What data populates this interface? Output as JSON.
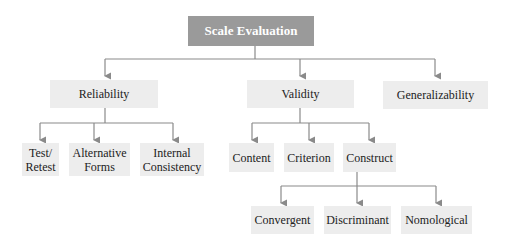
{
  "diagram": {
    "type": "hierarchy",
    "root": {
      "label": "Scale Evaluation"
    },
    "level1": [
      {
        "label": "Reliability"
      },
      {
        "label": "Validity"
      },
      {
        "label": "Generalizability"
      }
    ],
    "reliability_children": [
      {
        "line1": "Test/",
        "line2": "Retest"
      },
      {
        "line1": "Alternative",
        "line2": "Forms"
      },
      {
        "line1": "Internal",
        "line2": "Consistency"
      }
    ],
    "validity_children": [
      {
        "label": "Content"
      },
      {
        "label": "Criterion"
      },
      {
        "label": "Construct"
      }
    ],
    "construct_children": [
      {
        "label": "Convergent"
      },
      {
        "label": "Discriminant"
      },
      {
        "label": "Nomological"
      }
    ],
    "colors": {
      "root_fill": "#9a9a9a",
      "node_fill": "#ededed",
      "connector": "#8a8a8a"
    }
  }
}
